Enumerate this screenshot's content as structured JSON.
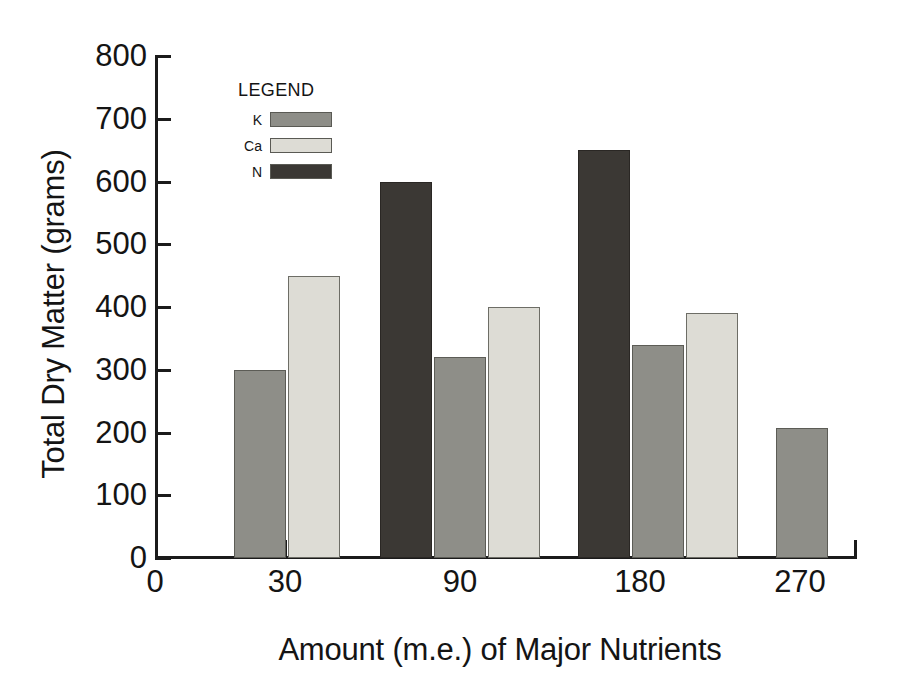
{
  "chart_data": {
    "type": "bar",
    "title": "",
    "xlabel": "Amount (m.e.) of Major Nutrients",
    "ylabel": "Total Dry Matter (grams)",
    "categories": [
      "0",
      "30",
      "90",
      "180",
      "270"
    ],
    "xticklabels": [
      "0",
      "30",
      "90",
      "180",
      "270"
    ],
    "yticklabels": [
      "0",
      "100",
      "200",
      "300",
      "400",
      "500",
      "600",
      "700",
      "800"
    ],
    "ylim": [
      0,
      800
    ],
    "ytick_step": 100,
    "grid": false,
    "legend_title": "LEGEND",
    "legend_position": "inside-upper-left",
    "series": [
      {
        "name": "K",
        "color": "#8e8e88",
        "values": [
          null,
          300,
          320,
          340,
          207
        ]
      },
      {
        "name": "Ca",
        "color": "#dddcd5",
        "values": [
          null,
          450,
          400,
          390,
          null
        ]
      },
      {
        "name": "N",
        "color": "#3b3834",
        "values": [
          null,
          null,
          600,
          650,
          null
        ]
      }
    ],
    "bars": [
      {
        "group": "30",
        "series": "N",
        "value": null,
        "x_px": 180,
        "width_px": 52
      },
      {
        "group": "30",
        "series": "K",
        "value": 300,
        "x_px": 234,
        "width_px": 52
      },
      {
        "group": "30",
        "series": "Ca",
        "value": 450,
        "x_px": 288,
        "width_px": 52
      },
      {
        "group": "90",
        "series": "N",
        "value": 600,
        "x_px": 380,
        "width_px": 52
      },
      {
        "group": "90",
        "series": "K",
        "value": 320,
        "x_px": 434,
        "width_px": 52
      },
      {
        "group": "90",
        "series": "Ca",
        "value": 400,
        "x_px": 488,
        "width_px": 52
      },
      {
        "group": "180",
        "series": "N",
        "value": 650,
        "x_px": 578,
        "width_px": 52
      },
      {
        "group": "180",
        "series": "K",
        "value": 340,
        "x_px": 632,
        "width_px": 52
      },
      {
        "group": "180",
        "series": "Ca",
        "value": 390,
        "x_px": 686,
        "width_px": 52
      },
      {
        "group": "270",
        "series": "K",
        "value": 207,
        "x_px": 776,
        "width_px": 52
      }
    ]
  },
  "axes": {
    "y_title": "Total Dry Matter (grams)",
    "x_title": "Amount (m.e.) of Major Nutrients",
    "y_ticks": [
      {
        "label": "800",
        "value": 800
      },
      {
        "label": "700",
        "value": 700
      },
      {
        "label": "600",
        "value": 600
      },
      {
        "label": "500",
        "value": 500
      },
      {
        "label": "400",
        "value": 400
      },
      {
        "label": "300",
        "value": 300
      },
      {
        "label": "200",
        "value": 200
      },
      {
        "label": "100",
        "value": 100
      },
      {
        "label": "0",
        "value": 0
      }
    ],
    "x_ticks": [
      {
        "label": "0",
        "x_px": 155
      },
      {
        "label": "30",
        "x_px": 285
      },
      {
        "label": "90",
        "x_px": 460
      },
      {
        "label": "180",
        "x_px": 640
      },
      {
        "label": "270",
        "x_px": 800
      }
    ]
  },
  "legend": {
    "title": "LEGEND",
    "items": [
      {
        "label": "K",
        "color": "#8e8e88"
      },
      {
        "label": "Ca",
        "color": "#dddcd5"
      },
      {
        "label": "N",
        "color": "#3b3834"
      }
    ]
  }
}
